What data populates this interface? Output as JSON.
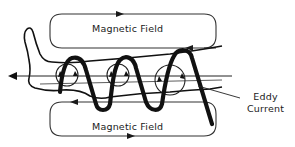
{
  "diagram": {
    "type": "eddy-current-induction",
    "labels": {
      "top_field": "Magnetic  Field",
      "bottom_field": "Magnetic  Field",
      "eddy_line1": "Eddy",
      "eddy_line2": "Current"
    },
    "elements": {
      "field_loops": 2,
      "coil_turns": 3,
      "eddy_current_circles": 3,
      "axis_arrow_direction": "left"
    },
    "colors": {
      "line": "#1a1a1a",
      "coil": "#111111",
      "background": "#ffffff"
    }
  }
}
